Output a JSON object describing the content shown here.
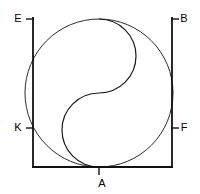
{
  "figure": {
    "background_color": "#ffffff",
    "stroke_color": "#1a1a1a",
    "frame_stroke_color": "#111111",
    "frame_stroke_width": 1.6,
    "curve_stroke_width": 1.0,
    "labels": [
      {
        "id": "E",
        "text": "E",
        "position": "top-left",
        "tick": "horizontal"
      },
      {
        "id": "B",
        "text": "B",
        "position": "top-right",
        "tick": "horizontal"
      },
      {
        "id": "K",
        "text": "K",
        "position": "middle-left",
        "tick": "horizontal"
      },
      {
        "id": "F",
        "text": "F",
        "position": "middle-right",
        "tick": "horizontal"
      },
      {
        "id": "A",
        "text": "A",
        "position": "bottom-center",
        "tick": "vertical"
      }
    ],
    "geometry": {
      "frame": {
        "left_x": 33,
        "right_x": 172,
        "top_y": 18,
        "bottom_y": 167
      },
      "circle": {
        "cx": 99,
        "cy": 93,
        "r": 74
      },
      "s_curve": {
        "upper_arc_r": 37,
        "lower_arc_r": 37,
        "start": [
          99,
          19
        ],
        "mid": [
          99,
          93
        ],
        "end": [
          99,
          167
        ]
      },
      "ticks": {
        "E_y": 19,
        "B_y": 19,
        "K_y": 128,
        "F_y": 128,
        "A_x": 99,
        "tick_length": 8
      }
    }
  }
}
